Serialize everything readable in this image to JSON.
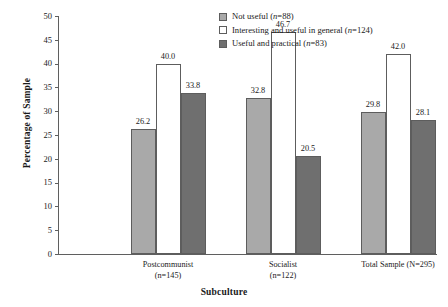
{
  "chart_data": {
    "type": "bar",
    "title": "",
    "xlabel": "Subculture",
    "ylabel": "Percentage of Sample",
    "ylim": [
      0,
      50
    ],
    "ytick_step": 5,
    "yticks": [
      "50",
      "45",
      "40",
      "35",
      "30",
      "25",
      "20",
      "15",
      "10",
      "5",
      "0"
    ],
    "grid": false,
    "legend_position": "top-right",
    "categories": [
      "Postcommunist (n=145)",
      "Socialist (n=122)",
      "Total Sample (N=295)"
    ],
    "category_labels": [
      {
        "line1": "Postcommunist",
        "line2": "(n=145)"
      },
      {
        "line1": "Socialist",
        "line2": "(n=122)"
      },
      {
        "line1": "Total Sample (N=295)",
        "line2": ""
      }
    ],
    "series": [
      {
        "name": "Not useful (n=88)",
        "legend_label": "Not useful (n=88)",
        "color": "#a9a9a9",
        "values": [
          26.2,
          32.8,
          29.8
        ],
        "value_labels": [
          "26.2",
          "32.8",
          "29.8"
        ]
      },
      {
        "name": "Interesting and useful in general (n=124)",
        "legend_label": "Interesting and useful in general (n=124)",
        "color": "#ffffff",
        "values": [
          40.0,
          46.7,
          42.0
        ],
        "value_labels": [
          "40.0",
          "46.7",
          "42.0"
        ]
      },
      {
        "name": "Useful and practical (n=83)",
        "legend_label": "Useful and practical (n=83)",
        "color": "#6f6f6f",
        "values": [
          33.8,
          20.5,
          28.1
        ],
        "value_labels": [
          "33.8",
          "20.5",
          "28.1"
        ]
      }
    ]
  },
  "legend": {
    "entries": [
      {
        "prefix": "Not useful (",
        "italic": "n",
        "suffix": "=88)"
      },
      {
        "prefix": "Interesting and useful in general (",
        "italic": "n",
        "suffix": "=124)"
      },
      {
        "prefix": "Useful and practical (",
        "italic": "n",
        "suffix": "=83)"
      }
    ]
  },
  "axis": {
    "x_title": "Subculture",
    "y_title": "Percentage of Sample"
  }
}
